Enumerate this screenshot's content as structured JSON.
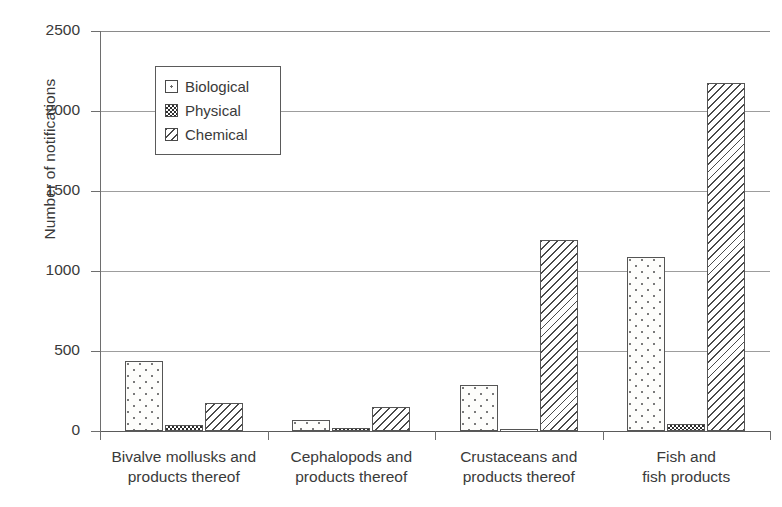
{
  "chart_data": {
    "type": "bar",
    "title": "",
    "xlabel": "",
    "ylabel": "Number of notifications",
    "ylim": [
      0,
      2500
    ],
    "yticks": [
      0,
      500,
      1000,
      1500,
      2000,
      2500
    ],
    "ytick_labels": [
      "0",
      "500",
      "1000",
      "1500",
      "2000",
      "2500"
    ],
    "grid": "horizontal",
    "legend_position": "upper-left-inside",
    "categories": [
      "Bivalve mollusks and products thereof",
      "Cephalopods and products thereof",
      "Crustaceans and products thereof",
      "Fish and fish products"
    ],
    "category_lines": [
      [
        "Bivalve mollusks and",
        "products thereof"
      ],
      [
        "Cephalopods and",
        "products thereof"
      ],
      [
        "Crustaceans and",
        "products thereof"
      ],
      [
        "Fish and",
        "fish products"
      ]
    ],
    "series": [
      {
        "name": "Biological",
        "pattern": "dots",
        "values": [
          440,
          70,
          290,
          1090
        ]
      },
      {
        "name": "Physical",
        "pattern": "checker",
        "values": [
          35,
          20,
          15,
          45
        ]
      },
      {
        "name": "Chemical",
        "pattern": "hatch",
        "values": [
          175,
          150,
          1195,
          2175
        ]
      }
    ]
  },
  "legend": {
    "items": [
      {
        "label": "Biological"
      },
      {
        "label": "Physical"
      },
      {
        "label": "Chemical"
      }
    ]
  },
  "colors": {
    "axis": "#6e6e6e",
    "grid": "#9d9d9d",
    "text": "#3a3a3a",
    "bar_outline": "#555555",
    "background": "#ffffff"
  }
}
